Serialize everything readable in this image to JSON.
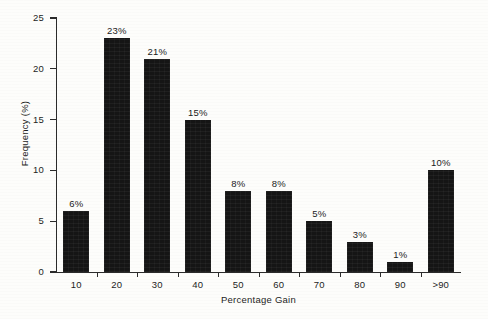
{
  "chart_data": {
    "type": "bar",
    "title": "",
    "xlabel": "Percentage Gain",
    "ylabel": "Frequency (%)",
    "categories": [
      "10",
      "20",
      "30",
      "40",
      "50",
      "60",
      "70",
      "80",
      "90",
      ">90"
    ],
    "values": [
      6,
      23,
      21,
      15,
      8,
      8,
      5,
      3,
      1,
      10
    ],
    "data_labels": [
      "6%",
      "23%",
      "21%",
      "15%",
      "8%",
      "8%",
      "5%",
      "3%",
      "1%",
      "10%"
    ],
    "ylim": [
      0,
      25
    ],
    "ytick_labels": [
      "0",
      "5",
      "10",
      "15",
      "20",
      "25"
    ],
    "ytick_values": [
      0,
      5,
      10,
      15,
      20,
      25
    ],
    "grid": false,
    "legend": false,
    "bar_color": "#151515",
    "axis_color": "#2b2b2b",
    "background_color": "#fdfdfb",
    "text_color": "#1d1d1d"
  }
}
